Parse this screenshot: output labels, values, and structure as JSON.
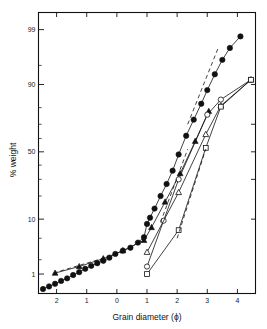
{
  "chart_data": {
    "type": "line",
    "title": "",
    "xlabel": "Grain diameter (ϕ)",
    "ylabel": "% weight",
    "xlim": [
      -2.6,
      4.6
    ],
    "ylim_percent": [
      0.35,
      99.6
    ],
    "yscale": "probability",
    "grid": false,
    "legend": "none",
    "xticks": [
      -2,
      -1,
      0,
      1,
      2,
      3,
      4
    ],
    "xtick_labels": [
      "2",
      "1",
      "0",
      "1",
      "2",
      "3",
      "4"
    ],
    "yticks_major": [
      1,
      10,
      50,
      90,
      99
    ],
    "ytick_labels": [
      "1",
      "10",
      "50",
      "90",
      "99"
    ],
    "yticks_minor": [
      2,
      5,
      20,
      30,
      40,
      60,
      70,
      80,
      95
    ],
    "series": [
      {
        "name": "filled-circles",
        "marker": "filled-circle",
        "x": [
          -2.45,
          -2.25,
          -2.05,
          -1.85,
          -1.65,
          -1.45,
          -1.25,
          -1.05,
          -0.85,
          -0.65,
          -0.45,
          -0.25,
          -0.05,
          0.2,
          0.45,
          0.7,
          0.9,
          1.0,
          1.1,
          1.25,
          1.45,
          1.65,
          1.85,
          2.05,
          2.3,
          2.55,
          2.8,
          3.0,
          3.25,
          3.5,
          3.75,
          4.1
        ],
        "y": [
          0.45,
          0.52,
          0.6,
          0.7,
          0.8,
          0.95,
          1.1,
          1.3,
          1.5,
          1.7,
          1.9,
          2.2,
          2.6,
          3.0,
          3.4,
          4.2,
          5.2,
          8.5,
          10.5,
          14.0,
          20.0,
          27.0,
          36.0,
          48.0,
          62.0,
          73.0,
          82.0,
          88.0,
          93.0,
          96.0,
          97.6,
          98.6
        ]
      },
      {
        "name": "filled-triangles",
        "marker": "filled-triangle",
        "x": [
          -2.05,
          -1.25,
          -0.45,
          0.2,
          0.9,
          1.15,
          1.6,
          2.1,
          2.6,
          3.05
        ],
        "y": [
          1.05,
          1.45,
          2.1,
          3.0,
          4.6,
          7.5,
          17.0,
          34.0,
          58.0,
          78.0
        ]
      },
      {
        "name": "open-circles",
        "marker": "open-circle",
        "x": [
          1.0,
          1.55,
          2.05,
          3.0,
          3.45,
          4.45
        ],
        "y": [
          1.45,
          9.5,
          30.0,
          76.0,
          84.0,
          91.5
        ]
      },
      {
        "name": "open-triangles",
        "marker": "open-triangle",
        "x": [
          1.0,
          2.05,
          2.95,
          3.45,
          4.45
        ],
        "y": [
          2.8,
          22.0,
          63.0,
          81.0,
          91.5
        ]
      },
      {
        "name": "open-squares",
        "marker": "open-square",
        "x": [
          1.0,
          2.05,
          2.95,
          3.45,
          4.45
        ],
        "y": [
          1.0,
          6.8,
          53.0,
          80.5,
          91.5
        ]
      },
      {
        "name": "dashed-guide-left",
        "marker": "none",
        "style": "dashed",
        "x": [
          -2.1,
          0.3
        ],
        "y": [
          1.05,
          2.9
        ]
      },
      {
        "name": "dashed-guide-mid",
        "marker": "none",
        "style": "dashed",
        "x": [
          1.45,
          2.35
        ],
        "y": [
          9.0,
          52.0
        ]
      },
      {
        "name": "dashed-guide-right",
        "marker": "none",
        "style": "dashed",
        "x": [
          2.0,
          2.95
        ],
        "y": [
          5.0,
          52.0
        ]
      },
      {
        "name": "dashed-guide-top",
        "marker": "none",
        "style": "dashed",
        "x": [
          2.35,
          3.35
        ],
        "y": [
          70.0,
          97.5
        ]
      }
    ]
  },
  "axes": {
    "x_title": "Grain diameter (ϕ)",
    "y_title": "% weight"
  }
}
